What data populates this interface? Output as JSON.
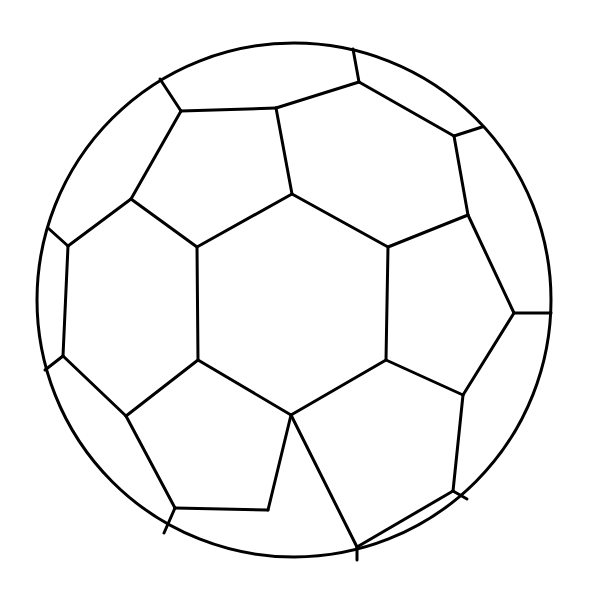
{
  "canvas": {
    "width": 589,
    "height": 610,
    "background": "#ffffff"
  },
  "drawing": {
    "subject": "soccer ball",
    "stroke_color": "#000000",
    "stroke_width": 3,
    "outline_circle": {
      "cx": 294,
      "cy": 300,
      "r": 257
    },
    "center_hexagon": [
      [
        197,
        247
      ],
      [
        292,
        194
      ],
      [
        388,
        247
      ],
      [
        386,
        360
      ],
      [
        291,
        415
      ],
      [
        198,
        360
      ]
    ],
    "panel_edges": [
      [
        [
          160,
          79
        ],
        [
          181,
          111
        ]
      ],
      [
        [
          181,
          111
        ],
        [
          276,
          108
        ]
      ],
      [
        [
          181,
          111
        ],
        [
          131,
          199
        ]
      ],
      [
        [
          276,
          108
        ],
        [
          292,
          194
        ]
      ],
      [
        [
          276,
          108
        ],
        [
          359,
          82
        ]
      ],
      [
        [
          359,
          82
        ],
        [
          353,
          49
        ]
      ],
      [
        [
          359,
          82
        ],
        [
          454,
          136
        ]
      ],
      [
        [
          454,
          136
        ],
        [
          482,
          127
        ]
      ],
      [
        [
          454,
          136
        ],
        [
          468,
          215
        ]
      ],
      [
        [
          468,
          215
        ],
        [
          388,
          247
        ]
      ],
      [
        [
          468,
          215
        ],
        [
          514,
          313
        ]
      ],
      [
        [
          514,
          313
        ],
        [
          551,
          313
        ]
      ],
      [
        [
          514,
          313
        ],
        [
          463,
          395
        ]
      ],
      [
        [
          463,
          395
        ],
        [
          386,
          360
        ]
      ],
      [
        [
          463,
          395
        ],
        [
          453,
          491
        ]
      ],
      [
        [
          453,
          491
        ],
        [
          467,
          499
        ]
      ],
      [
        [
          453,
          491
        ],
        [
          357,
          547
        ]
      ],
      [
        [
          357,
          547
        ],
        [
          357,
          560
        ]
      ],
      [
        [
          357,
          547
        ],
        [
          291,
          415
        ]
      ],
      [
        [
          291,
          415
        ],
        [
          268,
          510
        ]
      ],
      [
        [
          268,
          510
        ],
        [
          175,
          508
        ]
      ],
      [
        [
          175,
          508
        ],
        [
          164,
          533
        ]
      ],
      [
        [
          175,
          508
        ],
        [
          126,
          416
        ]
      ],
      [
        [
          126,
          416
        ],
        [
          198,
          360
        ]
      ],
      [
        [
          126,
          416
        ],
        [
          63,
          356
        ]
      ],
      [
        [
          63,
          356
        ],
        [
          45,
          370
        ]
      ],
      [
        [
          63,
          356
        ],
        [
          68,
          246
        ]
      ],
      [
        [
          68,
          246
        ],
        [
          48,
          228
        ]
      ],
      [
        [
          68,
          246
        ],
        [
          131,
          199
        ]
      ],
      [
        [
          131,
          199
        ],
        [
          197,
          247
        ]
      ]
    ]
  }
}
